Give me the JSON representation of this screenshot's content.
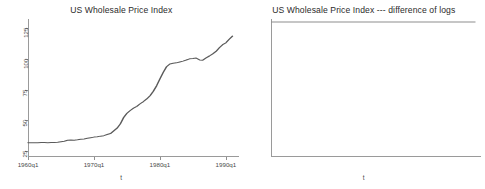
{
  "figure": {
    "background_color": "#ffffff",
    "axis_color": "#9a9a9a",
    "line_color": "#5a5a5a",
    "panels": 2
  },
  "chart_data": [
    {
      "type": "line",
      "title": "US Wholesale Price Index",
      "xlabel": "t",
      "ylabel": "",
      "grid": false,
      "legend": null,
      "xlim": [
        "1960q1",
        "1991q1"
      ],
      "ylim": [
        20,
        130
      ],
      "xticks": [
        "1960q1",
        "1970q1",
        "1980q1",
        "1990q1"
      ],
      "yticks": [
        25,
        50,
        75,
        100,
        125
      ],
      "x": [
        "1960q1",
        "1960q3",
        "1961q1",
        "1961q3",
        "1962q1",
        "1962q3",
        "1963q1",
        "1963q3",
        "1964q1",
        "1964q3",
        "1965q1",
        "1965q3",
        "1966q1",
        "1966q3",
        "1967q1",
        "1967q3",
        "1968q1",
        "1968q3",
        "1969q1",
        "1969q3",
        "1970q1",
        "1970q3",
        "1971q1",
        "1971q3",
        "1972q1",
        "1972q3",
        "1973q1",
        "1973q3",
        "1974q1",
        "1974q3",
        "1975q1",
        "1975q3",
        "1976q1",
        "1976q3",
        "1977q1",
        "1977q3",
        "1978q1",
        "1978q3",
        "1979q1",
        "1979q3",
        "1980q1",
        "1980q3",
        "1981q1",
        "1981q3",
        "1982q1",
        "1982q3",
        "1983q1",
        "1983q3",
        "1984q1",
        "1984q3",
        "1985q1",
        "1985q3",
        "1986q1",
        "1986q3",
        "1987q1",
        "1987q3",
        "1988q1",
        "1988q3",
        "1989q1",
        "1989q3",
        "1990q1",
        "1990q3",
        "1991q1"
      ],
      "values": [
        31.7,
        31.6,
        31.6,
        31.6,
        31.8,
        31.8,
        31.7,
        31.8,
        31.9,
        32.0,
        32.5,
        32.9,
        33.6,
        33.8,
        33.7,
        34.0,
        34.4,
        34.7,
        35.2,
        35.7,
        36.2,
        36.5,
        37.0,
        37.4,
        38.3,
        39.1,
        41.3,
        43.5,
        47.0,
        52.2,
        55.6,
        57.9,
        59.8,
        61.3,
        63.4,
        65.2,
        67.3,
        69.9,
        73.6,
        78.1,
        83.6,
        88.9,
        93.5,
        95.8,
        96.3,
        96.7,
        97.4,
        98.1,
        99.0,
        100.0,
        100.2,
        100.6,
        99.1,
        98.9,
        100.8,
        102.3,
        104.0,
        106.0,
        109.0,
        111.5,
        113.0,
        116.0,
        118.5
      ]
    },
    {
      "type": "line",
      "title": "US Wholesale Price Index --- difference of logs",
      "xlabel": "t",
      "ylabel": "",
      "grid": false,
      "legend": null,
      "xlim": [
        "1960q1",
        "1991q1"
      ],
      "ylim": [
        -0.045,
        0.09
      ],
      "xticks": [
        "1960q1",
        "1970q1",
        "1980q1",
        "1990q1"
      ],
      "yticks": [
        -0.04,
        -0.02,
        0,
        0.02,
        0.04,
        0.06,
        0.08
      ],
      "ytick_labels": [
        "-.04",
        "-.02",
        "0",
        ".02",
        ".04",
        ".06",
        ".08"
      ],
      "zero_line": 0,
      "values": [
        0.004,
        -0.002,
        0.006,
        -0.004,
        0.008,
        -0.006,
        0.005,
        -0.012,
        0.002,
        -0.008,
        0.006,
        0.0,
        0.009,
        -0.003,
        0.006,
        0.001,
        0.004,
        -0.002,
        0.007,
        0.002,
        0.01,
        0.004,
        0.012,
        0.002,
        0.009,
        -0.001,
        0.006,
        0.001,
        0.008,
        0.003,
        0.011,
        0.002,
        0.007,
        -0.002,
        0.005,
        -0.008,
        0.002,
        -0.006,
        0.001,
        -0.01,
        0.004,
        -0.003,
        0.009,
        0.001,
        0.013,
        0.004,
        0.018,
        0.006,
        0.01,
        0.002,
        0.016,
        0.005,
        0.012,
        0.001,
        0.009,
        0.003,
        0.014,
        0.006,
        0.019,
        0.008,
        0.015,
        0.005,
        0.011,
        0.002,
        0.013,
        0.006,
        0.021,
        0.01,
        0.015,
        0.004,
        0.018,
        0.008,
        0.022,
        0.011,
        0.016,
        0.007,
        0.012,
        0.018,
        0.042,
        0.025,
        0.048,
        0.03,
        0.022,
        0.011,
        0.061,
        0.035,
        0.07,
        0.04,
        0.028,
        0.006,
        0.02,
        0.004,
        0.014,
        0.002,
        0.018,
        0.008,
        0.024,
        0.012,
        0.019,
        0.006,
        0.026,
        0.013,
        0.031,
        0.017,
        0.024,
        0.009,
        0.033,
        0.018,
        0.04,
        0.022,
        0.028,
        0.014,
        0.035,
        0.019,
        0.026,
        0.012,
        0.03,
        0.016,
        0.022,
        0.01,
        0.028,
        0.014,
        0.02,
        0.008,
        0.001,
        -0.002,
        0.004,
        0.0,
        0.007,
        0.002,
        0.01,
        0.003,
        0.006,
        -0.001,
        0.009,
        0.001,
        0.005,
        -0.003,
        0.002,
        -0.008,
        -0.004,
        -0.014,
        -0.006,
        -0.02,
        -0.01,
        -0.002,
        0.004,
        -0.001,
        0.008,
        0.002,
        0.012,
        0.005,
        0.016,
        0.008,
        0.011,
        0.003,
        0.014,
        0.006,
        0.009,
        -0.001,
        0.012,
        0.004,
        -0.003,
        0.006,
        0.0,
        0.01,
        0.002,
        0.028
      ]
    }
  ],
  "panel_left": {
    "title": "US Wholesale Price Index",
    "xtitle": "t",
    "xticks": [
      "1960q1",
      "1970q1",
      "1980q1",
      "1990q1"
    ],
    "yticks": [
      "25",
      "50",
      "75",
      "100",
      "125"
    ]
  },
  "panel_right": {
    "title": "US Wholesale Price Index --- difference of logs",
    "xtitle": "t",
    "xticks": [
      "1960q1",
      "1970q1",
      "1980q1",
      "1990q1"
    ],
    "yticks": [
      "-.04",
      "-.02",
      "0",
      ".02",
      ".04",
      ".06",
      ".08"
    ]
  }
}
